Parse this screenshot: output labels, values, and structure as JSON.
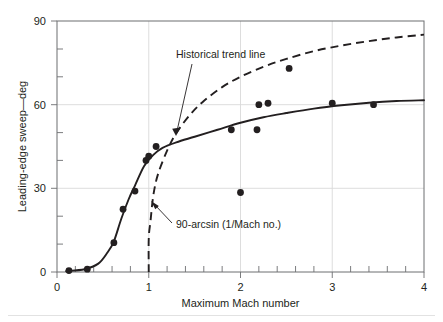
{
  "chart_data": {
    "type": "scatter",
    "title": "",
    "xlabel": "Maximum Mach number",
    "ylabel": "Leading-edge sweep—deg",
    "xlim": [
      0,
      4
    ],
    "ylim": [
      0,
      90
    ],
    "xticks": [
      0,
      1,
      2,
      3,
      4
    ],
    "xtick_labels": [
      "0",
      "1",
      "2",
      "3",
      "4"
    ],
    "yticks": [
      0,
      30,
      60,
      90
    ],
    "ytick_labels": [
      "0",
      "30",
      "60",
      "90"
    ],
    "x_minor_step": 0.2,
    "y_minor_step": 10,
    "grid": "major gridlines at y=30 and y=60, x=1, x=2, x=3",
    "legend": "none (curves labelled by in-plot annotations)",
    "points": [
      {
        "x": 0.13,
        "y": 0.5
      },
      {
        "x": 0.33,
        "y": 1.0
      },
      {
        "x": 0.62,
        "y": 10.5
      },
      {
        "x": 0.72,
        "y": 22.5
      },
      {
        "x": 0.85,
        "y": 29.0
      },
      {
        "x": 0.97,
        "y": 40.0
      },
      {
        "x": 1.0,
        "y": 41.5
      },
      {
        "x": 1.08,
        "y": 45.0
      },
      {
        "x": 1.9,
        "y": 51.0
      },
      {
        "x": 2.0,
        "y": 28.5
      },
      {
        "x": 2.18,
        "y": 51.0
      },
      {
        "x": 2.2,
        "y": 60.0
      },
      {
        "x": 2.3,
        "y": 60.5
      },
      {
        "x": 2.53,
        "y": 73.0
      },
      {
        "x": 3.0,
        "y": 60.5
      },
      {
        "x": 3.45,
        "y": 60.0
      }
    ],
    "series": [
      {
        "name": "Historical trend line",
        "style": "solid",
        "x": [
          0.1,
          0.3,
          0.45,
          0.55,
          0.62,
          0.7,
          0.78,
          0.85,
          0.95,
          1.05,
          1.15,
          1.3,
          1.5,
          1.75,
          2.0,
          2.25,
          2.5,
          2.8,
          3.1,
          3.4,
          3.7,
          4.0
        ],
        "y": [
          0.3,
          1.0,
          3.0,
          7.0,
          11.0,
          19.0,
          26.0,
          31.0,
          38.0,
          42.0,
          44.5,
          46.5,
          48.5,
          51.0,
          53.5,
          55.5,
          57.0,
          58.6,
          59.8,
          60.7,
          61.3,
          61.6
        ]
      },
      {
        "name": "90-arcsin (1/Mach no.)",
        "style": "dashed",
        "x": [
          1.0,
          1.0,
          1.02,
          1.05,
          1.1,
          1.2,
          1.3,
          1.45,
          1.6,
          1.8,
          2.0,
          2.25,
          2.5,
          2.8,
          3.1,
          3.4,
          3.7,
          4.0
        ],
        "y": [
          0.0,
          12.0,
          18.5,
          27.5,
          35.0,
          43.5,
          49.8,
          56.4,
          61.3,
          66.3,
          70.0,
          73.6,
          76.4,
          79.2,
          81.2,
          82.8,
          84.1,
          85.1
        ]
      }
    ],
    "annotations": [
      {
        "name": "historical-trend-line",
        "text": "Historical trend line",
        "points_to": "solid curve near Mach 1.4"
      },
      {
        "name": "arcsin-formula",
        "text": "90-arcsin (1/Mach no.)",
        "points_to": "dashed curve near Mach 1.1"
      }
    ]
  }
}
